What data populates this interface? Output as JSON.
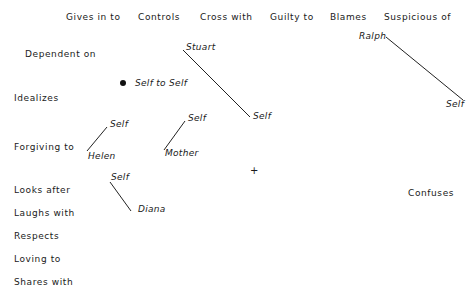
{
  "top_labels": [
    "Gives in to",
    "Controls",
    "Cross with",
    "Guilty to",
    "Blames",
    "Suspicious of"
  ],
  "left_labels": [
    "Dependent on",
    "Idealizes",
    "Forgiving to",
    "Looks after",
    "Laughs with",
    "Respects",
    "Loving to",
    "Shares with"
  ],
  "right_labels": [
    "Confuses"
  ],
  "points": {
    "self_to_self": "Self to Self",
    "stuart": "Stuart",
    "stuart_self": "Self",
    "ralph": "Ralph",
    "ralph_self": "Self",
    "helen": "Helen",
    "helen_self": "Self",
    "mother": "Mother",
    "mother_self": "Self",
    "diana": "Diana",
    "diana_self": "Self"
  },
  "markers": {
    "origin": "+"
  }
}
